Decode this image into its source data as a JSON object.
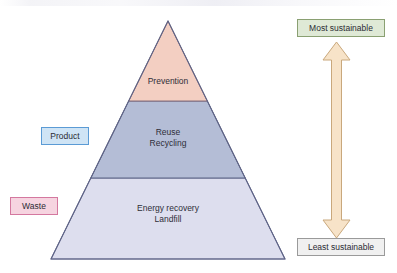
{
  "diagram": {
    "type": "pyramid-hierarchy"
  },
  "pyramid": {
    "tiers": [
      {
        "id": "prevention",
        "lines": [
          "Prevention"
        ],
        "fill": "#f3cfc2",
        "stroke": "#8b6e7a",
        "rank": 1
      },
      {
        "id": "reuse-recycling",
        "lines": [
          "Reuse",
          "Recycling"
        ],
        "fill": "#b4bdd6",
        "stroke": "#5a6284",
        "rank": 2
      },
      {
        "id": "energy-recovery-landfill",
        "lines": [
          "Energy recovery",
          "Landfill"
        ],
        "fill": "#dddeee",
        "stroke": "#6a6f96",
        "rank": 3
      }
    ]
  },
  "side_labels": {
    "product": {
      "label": "Product",
      "fill": "#cfe4f5",
      "stroke": "#5b9bd5"
    },
    "waste": {
      "label": "Waste",
      "fill": "#f6d4e0",
      "stroke": "#d4789f"
    }
  },
  "scale": {
    "top": {
      "label": "Most sustainable",
      "fill": "#dfe9d6",
      "stroke": "#8aa072"
    },
    "bottom": {
      "label": "Least sustainable",
      "fill": "#f0f0f0",
      "stroke": "#9a9a9a"
    },
    "arrow": {
      "name": "double-headed-vertical-arrow",
      "fill": "#f7e3c8",
      "stroke": "#c9a87c"
    }
  }
}
